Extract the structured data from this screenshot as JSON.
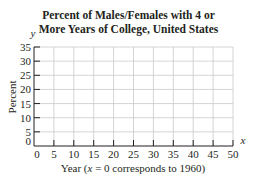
{
  "chart_data": {
    "type": "line",
    "title": "Percent of Males/Females with 4 or More Years of College, United States",
    "title_lines": [
      "Percent of Males/Females with 4 or",
      "More Years of College, United States"
    ],
    "xlabel": "Year (x = 0 corresponds to 1960)",
    "ylabel": "Percent",
    "x_axis_symbol": "x",
    "y_axis_symbol": "y",
    "xlim": [
      0,
      50
    ],
    "ylim": [
      0,
      35
    ],
    "x_ticks": [
      0,
      5,
      10,
      15,
      20,
      25,
      30,
      35,
      40,
      45,
      50
    ],
    "y_ticks": [
      0,
      5,
      10,
      15,
      20,
      25,
      30,
      35
    ],
    "grid": true,
    "legend": null,
    "series": []
  },
  "colors": {
    "axis": "#231f20",
    "grid": "#c9c9c9",
    "background": "#ffffff"
  }
}
